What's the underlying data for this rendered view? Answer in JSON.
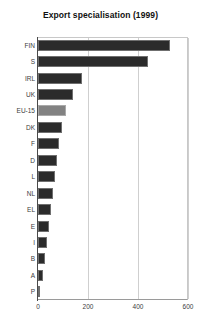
{
  "chart_data": {
    "type": "bar",
    "orientation": "horizontal",
    "title": "Export specialisation (1999)",
    "xlabel": "",
    "ylabel": "",
    "categories": [
      "FIN",
      "S",
      "IRL",
      "UK",
      "EU-15",
      "DK",
      "F",
      "D",
      "L",
      "NL",
      "EL",
      "E",
      "I",
      "B",
      "A",
      "P"
    ],
    "values": [
      528,
      440,
      176,
      140,
      112,
      96,
      82,
      76,
      68,
      60,
      52,
      44,
      36,
      28,
      20,
      8
    ],
    "xlim": [
      0,
      600
    ],
    "xticks": [
      0,
      200,
      400,
      600
    ],
    "xtick_labels": [
      "0",
      "200",
      "400",
      "600"
    ],
    "grid": true,
    "grid_axis": "x",
    "legend": null,
    "highlight_category": "EU-15",
    "colors": {
      "bar": "#2b2b2b",
      "bar_highlight": "#828282",
      "bar_border": "#6f6f6f",
      "gridline": "#cfcfcf",
      "axis": "#4a4a4a",
      "text": "#3c3c3c",
      "title": "#111111",
      "background": "#ffffff"
    }
  }
}
